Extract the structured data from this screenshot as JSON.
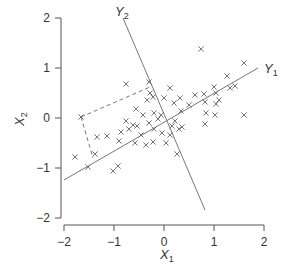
{
  "chart_data": {
    "type": "scatter",
    "title": "",
    "xlabel": "X1",
    "ylabel": "X2",
    "xlim": [
      -2,
      2
    ],
    "ylim": [
      -2,
      2
    ],
    "grid": false,
    "legend": null,
    "x_ticks": [
      "-2",
      "-1",
      "0",
      "1",
      "2"
    ],
    "y_ticks": [
      "-2",
      "-1",
      "0",
      "1",
      "2"
    ],
    "marker": "x",
    "points": [
      [
        -1.66,
        0.02
      ],
      [
        -1.78,
        -0.78
      ],
      [
        -1.52,
        -0.98
      ],
      [
        -1.38,
        -0.72
      ],
      [
        -1.02,
        -1.06
      ],
      [
        -0.92,
        -0.96
      ],
      [
        -1.34,
        -0.38
      ],
      [
        -1.14,
        -0.36
      ],
      [
        -0.76,
        0.68
      ],
      [
        -0.76,
        -0.06
      ],
      [
        -0.7,
        -0.22
      ],
      [
        -0.86,
        -0.28
      ],
      [
        -0.62,
        -0.14
      ],
      [
        -0.54,
        -0.16
      ],
      [
        -0.56,
        0.18
      ],
      [
        -0.42,
        0.06
      ],
      [
        -0.34,
        0.36
      ],
      [
        -0.28,
        0.5
      ],
      [
        -0.22,
        0.42
      ],
      [
        -0.46,
        -0.34
      ],
      [
        -0.9,
        -0.46
      ],
      [
        -0.58,
        -0.5
      ],
      [
        -0.3,
        -0.1
      ],
      [
        -0.2,
        -0.22
      ],
      [
        -0.2,
        0.1
      ],
      [
        -0.12,
        -0.02
      ],
      [
        -0.06,
        0.06
      ],
      [
        -0.04,
        -0.3
      ],
      [
        0.04,
        -0.5
      ],
      [
        0.12,
        -0.34
      ],
      [
        0.16,
        -0.16
      ],
      [
        0.22,
        -0.06
      ],
      [
        0.3,
        -0.22
      ],
      [
        0.36,
        -0.18
      ],
      [
        -0.36,
        -0.54
      ],
      [
        -0.22,
        -0.48
      ],
      [
        0.26,
        -0.72
      ],
      [
        0.0,
        0.4
      ],
      [
        0.12,
        0.6
      ],
      [
        0.2,
        0.3
      ],
      [
        0.32,
        0.4
      ],
      [
        0.5,
        0.26
      ],
      [
        0.34,
        0.14
      ],
      [
        0.62,
        0.46
      ],
      [
        0.8,
        0.48
      ],
      [
        0.82,
        0.32
      ],
      [
        0.84,
        0.1
      ],
      [
        0.82,
        -0.12
      ],
      [
        0.74,
        1.38
      ],
      [
        1.0,
        0.62
      ],
      [
        1.04,
        0.5
      ],
      [
        1.04,
        0.28
      ],
      [
        1.02,
        0.06
      ],
      [
        1.1,
        0.36
      ],
      [
        1.26,
        0.84
      ],
      [
        1.32,
        0.6
      ],
      [
        1.42,
        0.64
      ],
      [
        1.6,
        1.1
      ],
      [
        1.6,
        0.06
      ],
      [
        -0.3,
        0.72
      ]
    ],
    "lines": {
      "Y1": {
        "label": "Y",
        "sub": "1",
        "from": [
          -2.0,
          -1.24
        ],
        "to": [
          1.88,
          1.0
        ],
        "style": "solid"
      },
      "Y2": {
        "label": "Y",
        "sub": "2",
        "from": [
          -0.82,
          2.0
        ],
        "to": [
          0.82,
          -1.84
        ],
        "style": "solid"
      }
    },
    "projection_dashes": [
      {
        "from": [
          -1.66,
          0.02
        ],
        "to": [
          -0.28,
          0.62
        ]
      },
      {
        "from": [
          -1.66,
          0.02
        ],
        "to": [
          -1.42,
          -0.8
        ]
      }
    ]
  },
  "axes": {
    "x_title": "X",
    "x_title_sub": "1",
    "y_title": "X",
    "y_title_sub": "2"
  },
  "colors": {
    "axis": "#555555",
    "line": "#777777",
    "marker": "#666666",
    "text": "#333333"
  }
}
